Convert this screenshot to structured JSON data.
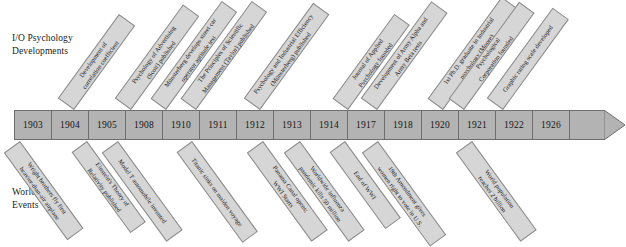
{
  "sections": {
    "top_label": "I/O Psychology\nDevelopments",
    "bottom_label": "World\nEvents"
  },
  "timeline": {
    "years": [
      "1903",
      "1904",
      "1905",
      "1908",
      "1910",
      "1911",
      "1912",
      "1913",
      "1914",
      "1917",
      "1918",
      "1920",
      "1921",
      "1922",
      "1926"
    ],
    "arrow_direction": "right",
    "bar_color": "#b3b3b3",
    "ribbon_color": "#d6d6d6",
    "border_color": "#6e6e6e"
  },
  "io_developments": [
    {
      "year": "1904",
      "text": "Development of\ncorrelation coefficient"
    },
    {
      "year": "1910",
      "text": "Psychology of Advertising\n(Scott) published"
    },
    {
      "year": "1911",
      "text": "Münsterberg develops street car\noperator aptitude test"
    },
    {
      "year": "1911",
      "text": "The Principles of Scientific\nManagement (Taylor) published"
    },
    {
      "year": "1913",
      "text": "Psychology and Industrial Efficiency\n(Münsterberg) published"
    },
    {
      "year": "1917",
      "text": "Journal of Applied\nPsychology founded"
    },
    {
      "year": "1918",
      "text": "Development of Army Alpha and\nArmy Beta tests"
    },
    {
      "year": "1921",
      "text": "1st Ph.D. graduate in industrial\npsychology (Moore)"
    },
    {
      "year": "1921",
      "text": "Psychological\nCorporation founded"
    },
    {
      "year": "1922",
      "text": "Graphic rating scale developed"
    }
  ],
  "world_events": [
    {
      "year": "1903",
      "text": "Wright brothers fly first\nheavier-than-air airplane"
    },
    {
      "year": "1905",
      "text": "Einstein's Theory of\nRelativity published"
    },
    {
      "year": "1908",
      "text": "Model T automobile invented"
    },
    {
      "year": "1912",
      "text": "Titanic sinks on maiden voyage"
    },
    {
      "year": "1914",
      "text": "Panama Canal opens;\nWWI Starts"
    },
    {
      "year": "1918",
      "text": "Worldwide influenza\npandemic kills 50 million"
    },
    {
      "year": "1918",
      "text": "End of WWI"
    },
    {
      "year": "1920",
      "text": "19th Amendment gives\nwomen right to vote in U.S."
    },
    {
      "year": "1926",
      "text": "World population\nreaches 2 billion"
    }
  ],
  "layout": {
    "io_ribbons": [
      {
        "left": 74,
        "bottom": 110,
        "length": 104,
        "thickness": 20
      },
      {
        "left": 131,
        "bottom": 110,
        "length": 116,
        "thickness": 20
      },
      {
        "left": 166,
        "bottom": 110,
        "length": 121,
        "thickness": 19
      },
      {
        "left": 196,
        "bottom": 110,
        "length": 121,
        "thickness": 19
      },
      {
        "left": 260,
        "bottom": 110,
        "length": 118,
        "thickness": 20
      },
      {
        "left": 348,
        "bottom": 110,
        "length": 105,
        "thickness": 19
      },
      {
        "left": 377,
        "bottom": 110,
        "length": 120,
        "thickness": 20
      },
      {
        "left": 443,
        "bottom": 110,
        "length": 126,
        "thickness": 19
      },
      {
        "left": 464,
        "bottom": 110,
        "length": 120,
        "thickness": 19
      },
      {
        "left": 503,
        "bottom": 110,
        "length": 112,
        "thickness": 20
      }
    ],
    "world_ribbons": [
      {
        "left": 20,
        "top": 141,
        "length": 108,
        "thickness": 20
      },
      {
        "left": 87,
        "top": 141,
        "length": 100,
        "thickness": 19
      },
      {
        "left": 118,
        "top": 141,
        "length": 110,
        "thickness": 20
      },
      {
        "left": 192,
        "top": 141,
        "length": 112,
        "thickness": 19
      },
      {
        "left": 263,
        "top": 141,
        "length": 110,
        "thickness": 20
      },
      {
        "left": 300,
        "top": 141,
        "length": 110,
        "thickness": 20
      },
      {
        "left": 345,
        "top": 141,
        "length": 95,
        "thickness": 19
      },
      {
        "left": 378,
        "top": 141,
        "length": 116,
        "thickness": 20
      },
      {
        "left": 472,
        "top": 141,
        "length": 110,
        "thickness": 20
      }
    ]
  }
}
